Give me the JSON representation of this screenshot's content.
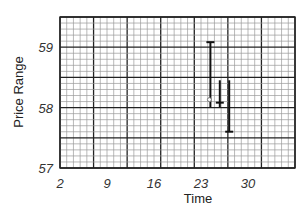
{
  "chart_data": {
    "type": "ohlc",
    "title": "",
    "xlabel": "Time",
    "ylabel": "Price Range",
    "xlim": [
      2,
      37
    ],
    "ylim": [
      56.99,
      59.5
    ],
    "x_ticks": [
      2,
      9,
      16,
      23,
      30
    ],
    "y_ticks": [
      57,
      58,
      59
    ],
    "grid": true,
    "grid_style": "graph-paper: major lines every 7 time units and 0.5 price units, 5 minor subdivisions each",
    "legend": null,
    "series": [
      {
        "name": "price bars",
        "points": [
          {
            "x": 24.4,
            "high": 59.08,
            "low": 58.0,
            "open": 58.13,
            "close": 59.08
          },
          {
            "x": 25.8,
            "high": 58.45,
            "low": 58.0,
            "close": 58.08
          },
          {
            "x": 27.2,
            "high": 58.45,
            "low": 57.6,
            "close": 57.6
          }
        ]
      }
    ]
  },
  "colors": {
    "background": "#ffffff",
    "grid_minor": "#9a9a9a",
    "grid_major": "#222222",
    "bars": "#111111"
  }
}
